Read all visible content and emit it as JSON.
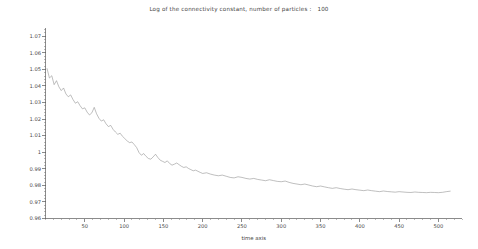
{
  "chart_data": {
    "type": "line",
    "title": "Log of the connectivity constant, number of particles :   100",
    "xlabel": "time axis",
    "ylabel": "",
    "xlim": [
      0,
      530
    ],
    "ylim": [
      0.96,
      1.075
    ],
    "grid": false,
    "legend": null,
    "xticks": [
      50,
      100,
      150,
      200,
      250,
      300,
      350,
      400,
      450,
      500
    ],
    "xtick_labels": [
      "50",
      "100",
      "150",
      "200",
      "250",
      "300",
      "350",
      "400",
      "450",
      "500"
    ],
    "xminor_step": 10,
    "yticks": [
      0.96,
      0.97,
      0.98,
      0.99,
      1,
      1.01,
      1.02,
      1.03,
      1.04,
      1.05,
      1.06,
      1.07
    ],
    "ytick_labels": [
      "0.96",
      "0.97",
      "0.98",
      "0.99",
      "1",
      "1.01",
      "1.02",
      "1.03",
      "1.04",
      "1.05",
      "1.06",
      "1.07"
    ],
    "yminor_step": 0.002,
    "line_color": "#8a8a8a",
    "line_width": 0.55,
    "series": [
      {
        "name": "log connectivity constant",
        "x": [
          2,
          5,
          8,
          11,
          14,
          17,
          20,
          23,
          26,
          29,
          32,
          35,
          38,
          41,
          44,
          47,
          50,
          53,
          56,
          59,
          62,
          65,
          68,
          71,
          74,
          77,
          80,
          83,
          86,
          89,
          92,
          95,
          98,
          101,
          104,
          107,
          110,
          113,
          116,
          119,
          122,
          125,
          128,
          131,
          134,
          137,
          140,
          143,
          146,
          149,
          152,
          155,
          158,
          161,
          164,
          167,
          170,
          173,
          176,
          179,
          182,
          185,
          188,
          191,
          194,
          197,
          200,
          205,
          210,
          215,
          220,
          225,
          230,
          235,
          240,
          245,
          250,
          255,
          260,
          265,
          270,
          275,
          280,
          285,
          290,
          295,
          300,
          305,
          310,
          315,
          320,
          325,
          330,
          335,
          340,
          345,
          350,
          355,
          360,
          365,
          370,
          375,
          380,
          385,
          390,
          395,
          400,
          405,
          410,
          415,
          420,
          425,
          430,
          435,
          440,
          445,
          450,
          455,
          460,
          465,
          470,
          475,
          480,
          485,
          490,
          495,
          500,
          505,
          510,
          515
        ],
        "y": [
          1.0505,
          1.0448,
          1.0462,
          1.0408,
          1.0432,
          1.0395,
          1.0372,
          1.0388,
          1.0352,
          1.0335,
          1.0346,
          1.0318,
          1.0296,
          1.0305,
          1.0281,
          1.0262,
          1.0268,
          1.0242,
          1.0225,
          1.0238,
          1.0271,
          1.0232,
          1.0205,
          1.0188,
          1.0196,
          1.0172,
          1.0155,
          1.0162,
          1.0138,
          1.0122,
          1.0108,
          1.0115,
          1.0096,
          1.0082,
          1.0068,
          1.0058,
          1.0062,
          1.0046,
          1.0028,
          0.9998,
          0.9982,
          0.9992,
          0.9975,
          0.9962,
          0.9958,
          0.9972,
          0.9988,
          0.9968,
          0.9952,
          0.9945,
          0.9938,
          0.9948,
          0.9932,
          0.9922,
          0.9928,
          0.9935,
          0.9925,
          0.9915,
          0.9908,
          0.9912,
          0.9902,
          0.9895,
          0.9888,
          0.9892,
          0.9885,
          0.9878,
          0.9872,
          0.9876,
          0.9868,
          0.9862,
          0.9858,
          0.9862,
          0.9855,
          0.9848,
          0.9845,
          0.9852,
          0.9848,
          0.9842,
          0.9838,
          0.9842,
          0.9836,
          0.9832,
          0.9828,
          0.9834,
          0.9829,
          0.9824,
          0.9822,
          0.9826,
          0.9818,
          0.9812,
          0.9808,
          0.9804,
          0.9808,
          0.9802,
          0.9796,
          0.9792,
          0.9796,
          0.9791,
          0.9786,
          0.9782,
          0.9786,
          0.9781,
          0.9777,
          0.9774,
          0.9778,
          0.9774,
          0.9771,
          0.9768,
          0.9772,
          0.9768,
          0.9765,
          0.9762,
          0.9766,
          0.9763,
          0.9761,
          0.9759,
          0.9762,
          0.976,
          0.9758,
          0.9757,
          0.976,
          0.9758,
          0.9757,
          0.9756,
          0.9758,
          0.9757,
          0.9756,
          0.9758,
          0.9762,
          0.9765
        ]
      }
    ]
  }
}
